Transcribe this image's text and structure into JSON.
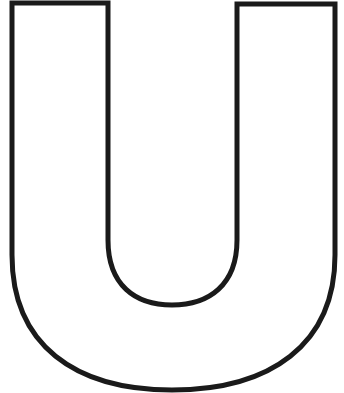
{
  "figure": {
    "letter": "U",
    "stroke_color": "#1a1a1a",
    "fill_color": "#ffffff",
    "background": "#ffffff"
  }
}
